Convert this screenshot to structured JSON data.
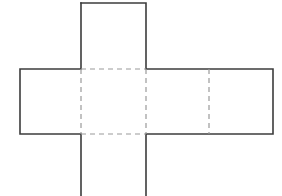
{
  "figure": {
    "label": "b.",
    "caption": "",
    "background_color": "#fdfdfd",
    "solid_line_color": "#3c3c3c",
    "fold_line_color": "#9a9a9a",
    "canvas": {
      "width": 282,
      "height": 196
    },
    "faces": [
      {
        "name": "top-face",
        "x": 81,
        "y": 3,
        "width": 65,
        "height": 66
      },
      {
        "name": "left-face",
        "x": 20,
        "y": 69,
        "width": 61,
        "height": 65
      },
      {
        "name": "center-face",
        "x": 81,
        "y": 69,
        "width": 65,
        "height": 65
      },
      {
        "name": "right-face",
        "x": 146,
        "y": 69,
        "width": 63,
        "height": 65
      },
      {
        "name": "far-face",
        "x": 209,
        "y": 69,
        "width": 64,
        "height": 65
      },
      {
        "name": "bottom-face",
        "x": 81,
        "y": 134,
        "width": 65,
        "height": 62
      }
    ],
    "outline_points": "81,3 146,3 146,69 273,69 273,134 146,134 146,196 81,196 81,134 20,134 20,69 81,69 81,3",
    "fold_lines": [
      {
        "name": "fold-top-horizontal",
        "x1": 81,
        "y1": 69,
        "x2": 146,
        "y2": 69
      },
      {
        "name": "fold-bottom-horizontal",
        "x1": 81,
        "y1": 134,
        "x2": 146,
        "y2": 134
      },
      {
        "name": "fold-left-vertical",
        "x1": 81,
        "y1": 69,
        "x2": 81,
        "y2": 134
      },
      {
        "name": "fold-center-vertical",
        "x1": 146,
        "y1": 69,
        "x2": 146,
        "y2": 134
      },
      {
        "name": "fold-right-vertical",
        "x1": 209,
        "y1": 69,
        "x2": 209,
        "y2": 134
      }
    ]
  }
}
